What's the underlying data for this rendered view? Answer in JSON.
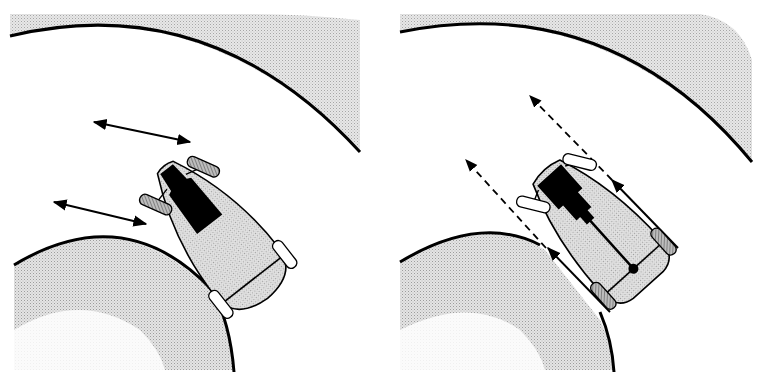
{
  "figure": {
    "description": "Two overhead views of a car cornering on a curved road",
    "panels": [
      {
        "id": "left",
        "drive": "front-wheel drive",
        "front_wheels": "shaded (driven)",
        "rear_wheels": "plain",
        "force_arrows": "solid, pointing outward from front wheels"
      },
      {
        "id": "right",
        "drive": "rear-wheel drive",
        "front_wheels": "plain",
        "rear_wheels": "shaded (driven)",
        "force_arrows": "solid along body sides, dashed continuation past front wheels"
      }
    ]
  },
  "colors": {
    "ink": "#000000",
    "shade": "#d9d9d9",
    "background": "#ffffff",
    "wheel_plain": "#ffffff",
    "wheel_driven": "#9a9a9a"
  }
}
